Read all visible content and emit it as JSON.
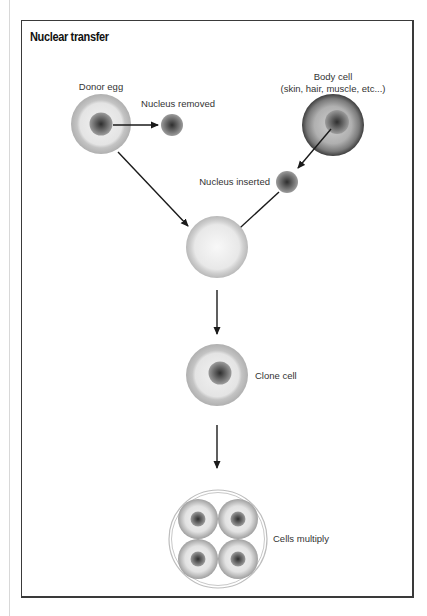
{
  "title": "Nuclear transfer",
  "labels": {
    "donor_egg": "Donor egg",
    "nucleus_removed": "Nucleus removed",
    "body_cell_line1": "Body cell",
    "body_cell_line2": "(skin, hair, muscle, etc...)",
    "nucleus_inserted": "Nucleus inserted",
    "clone_cell": "Clone cell",
    "cells_multiply": "Cells multiply"
  },
  "steps": [
    "Donor egg",
    "Nucleus removed",
    "Body cell",
    "Nucleus inserted",
    "Fused egg",
    "Clone cell",
    "Cells multiply"
  ],
  "colors": {
    "frame": "#3a3a3a",
    "arrow": "#1a1a1a",
    "text": "#333333"
  }
}
